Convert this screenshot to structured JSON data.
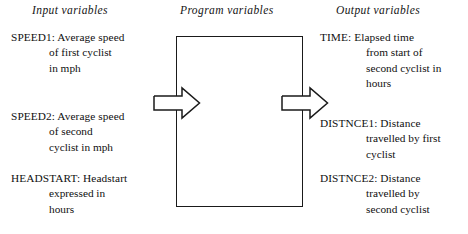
{
  "headers": {
    "input": "Input variables",
    "program": "Program variables",
    "output": "Output variables"
  },
  "input_variables": [
    {
      "name": "SPEED1:",
      "lines": [
        "SPEED1: Average speed",
        "of first cyclist",
        "in mph"
      ],
      "description": "Average speed of first cyclist in mph"
    },
    {
      "name": "SPEED2:",
      "lines": [
        "SPEED2: Average speed",
        "of second",
        "cyclist in mph"
      ],
      "description": "Average speed of second cyclist in mph"
    },
    {
      "name": "HEADSTART:",
      "lines": [
        "HEADSTART: Headstart",
        "expressed in",
        "hours"
      ],
      "description": "Headstart expressed in hours"
    }
  ],
  "output_variables": [
    {
      "name": "TIME:",
      "lines": [
        "TIME: Elapsed time",
        "from start of",
        "second cyclist in",
        "hours"
      ],
      "description": "Elapsed time from start of second cyclist in hours"
    },
    {
      "name": "DISTNCE1:",
      "lines": [
        "DISTNCE1: Distance",
        "travelled by first",
        "cyclist"
      ],
      "description": "Distance travelled by first cyclist"
    },
    {
      "name": "DISTNCE2:",
      "lines": [
        "DISTNCE2: Distance",
        "travelled by",
        "second cyclist"
      ],
      "description": "Distance travelled by second cyclist"
    }
  ],
  "diagram": {
    "program_box_label": "",
    "arrow_in_name": "input-arrow",
    "arrow_out_name": "output-arrow",
    "line_color": "#1a1a1a",
    "background": "#ffffff"
  }
}
